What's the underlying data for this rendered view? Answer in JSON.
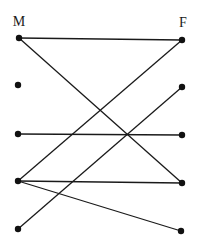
{
  "diagram": {
    "type": "bipartite-graph",
    "width": 198,
    "height": 246,
    "colors": {
      "node": "#111111",
      "edge": "#1a1a1a",
      "background": "#ffffff"
    },
    "columns": {
      "left": {
        "label": "M",
        "label_x": 19,
        "label_y": 26
      },
      "right": {
        "label": "F",
        "label_x": 183,
        "label_y": 27
      }
    },
    "nodes": [
      {
        "id": "M1",
        "side": "left",
        "x": 19,
        "y": 38
      },
      {
        "id": "M2",
        "side": "left",
        "x": 18,
        "y": 85
      },
      {
        "id": "M3",
        "side": "left",
        "x": 18,
        "y": 134
      },
      {
        "id": "M4",
        "side": "left",
        "x": 18,
        "y": 181
      },
      {
        "id": "M5",
        "side": "left",
        "x": 18,
        "y": 229
      },
      {
        "id": "F1",
        "side": "right",
        "x": 182,
        "y": 40
      },
      {
        "id": "F2",
        "side": "right",
        "x": 182,
        "y": 87
      },
      {
        "id": "F3",
        "side": "right",
        "x": 182,
        "y": 135
      },
      {
        "id": "F4",
        "side": "right",
        "x": 182,
        "y": 183
      },
      {
        "id": "F5",
        "side": "right",
        "x": 181,
        "y": 231
      }
    ],
    "edges": [
      {
        "from": "M1",
        "to": "F1"
      },
      {
        "from": "M1",
        "to": "F4"
      },
      {
        "from": "M3",
        "to": "F3"
      },
      {
        "from": "M4",
        "to": "F1"
      },
      {
        "from": "M4",
        "to": "F4"
      },
      {
        "from": "M4",
        "to": "F5"
      },
      {
        "from": "M5",
        "to": "F2"
      }
    ]
  }
}
